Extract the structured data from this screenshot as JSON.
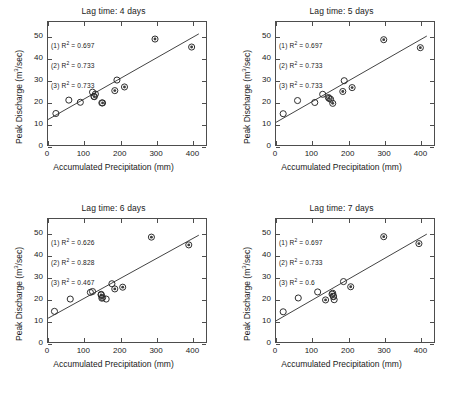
{
  "figure": {
    "axis_label_x": "Accumulated Precipitation (mm)",
    "axis_label_y_pre": "Peak Discharge (m",
    "axis_label_y_sup": "3",
    "axis_label_y_post": "/sec)",
    "r2_symbol": "R",
    "r2_exponent": "2"
  },
  "chart_data": [
    {
      "type": "scatter",
      "title": "Lag time: 4 days",
      "xlabel": "Accumulated Precipitation (mm)",
      "ylabel": "Peak Discharge (m3/sec)",
      "xlim": [
        0,
        440
      ],
      "ylim": [
        0,
        57
      ],
      "xticks": [
        0,
        100,
        200,
        300,
        400
      ],
      "yticks": [
        0,
        10,
        20,
        30,
        40,
        50
      ],
      "grid": false,
      "annotations": [
        "(1) R2 = 0.697",
        "(2) R2 = 0.733",
        "(3) R2 = 0.733"
      ],
      "r2_values": [
        0.697,
        0.733,
        0.733
      ],
      "fit_line": {
        "x0": 0,
        "y0": 11.8,
        "x1": 420,
        "y1": 51.5
      },
      "series": [
        {
          "name": "open-circle",
          "marker": "open",
          "points": [
            [
              22,
              14.6
            ],
            [
              58,
              20.8
            ],
            [
              90,
              19.8
            ],
            [
              124,
              24.5
            ],
            [
              132,
              23.6
            ],
            [
              128,
              22.5
            ],
            [
              150,
              19.5
            ],
            [
              192,
              30.1
            ]
          ]
        },
        {
          "name": "dotted-circle",
          "marker": "dot",
          "points": [
            [
              129,
              22.4
            ],
            [
              152,
              19.5
            ],
            [
              186,
              25.2
            ],
            [
              213,
              26.9
            ],
            [
              298,
              49.1
            ],
            [
              400,
              45.4
            ]
          ]
        }
      ]
    },
    {
      "type": "scatter",
      "title": "Lag time: 5 days",
      "xlabel": "Accumulated Precipitation (mm)",
      "ylabel": "Peak Discharge (m3/sec)",
      "xlim": [
        0,
        440
      ],
      "ylim": [
        0,
        57
      ],
      "xticks": [
        0,
        100,
        200,
        300,
        400
      ],
      "yticks": [
        0,
        10,
        20,
        30,
        40,
        50
      ],
      "grid": false,
      "annotations": [
        "(1) R2 = 0.697",
        "(2) R2 = 0.733",
        "(3) R2 = 0.733"
      ],
      "r2_values": [
        0.697,
        0.733,
        0.733
      ],
      "fit_line": {
        "x0": 0,
        "y0": 10.5,
        "x1": 420,
        "y1": 50.5
      },
      "series": [
        {
          "name": "open-circle",
          "marker": "open",
          "points": [
            [
              20,
              14.5
            ],
            [
              60,
              20.6
            ],
            [
              108,
              19.7
            ],
            [
              130,
              23.5
            ],
            [
              146,
              22.0
            ],
            [
              152,
              21.2
            ],
            [
              190,
              29.8
            ]
          ]
        },
        {
          "name": "dotted-circle",
          "marker": "dot",
          "points": [
            [
              148,
              21.6
            ],
            [
              158,
              19.3
            ],
            [
              186,
              24.8
            ],
            [
              212,
              26.6
            ],
            [
              300,
              48.8
            ],
            [
              402,
              45.1
            ]
          ]
        }
      ]
    },
    {
      "type": "scatter",
      "title": "Lag time: 6 days",
      "xlabel": "Accumulated Precipitation (mm)",
      "ylabel": "Peak Discharge (m3/sec)",
      "xlim": [
        0,
        440
      ],
      "ylim": [
        0,
        57
      ],
      "xticks": [
        0,
        100,
        200,
        300,
        400
      ],
      "yticks": [
        0,
        10,
        20,
        30,
        40,
        50
      ],
      "grid": false,
      "annotations": [
        "(1) R2 = 0.626",
        "(2) R2 = 0.828",
        "(3) R2 = 0.467"
      ],
      "r2_values": [
        0.626,
        0.828,
        0.467
      ],
      "fit_line": {
        "x0": 0,
        "y0": 11.0,
        "x1": 420,
        "y1": 49.5
      },
      "series": [
        {
          "name": "open-circle",
          "marker": "open",
          "points": [
            [
              18,
              14.2
            ],
            [
              62,
              19.9
            ],
            [
              118,
              23.0
            ],
            [
              124,
              23.4
            ],
            [
              148,
              22.1
            ],
            [
              152,
              20.6
            ],
            [
              162,
              19.9
            ],
            [
              178,
              27.0
            ]
          ]
        },
        {
          "name": "dotted-circle",
          "marker": "dot",
          "points": [
            [
              148,
              21.8
            ],
            [
              150,
              20.3
            ],
            [
              186,
              24.6
            ],
            [
              208,
              25.4
            ],
            [
              288,
              48.6
            ],
            [
              392,
              45.0
            ]
          ]
        }
      ]
    },
    {
      "type": "scatter",
      "title": "Lag time: 7 days",
      "xlabel": "Accumulated Precipitation (mm)",
      "ylabel": "Peak Discharge (m3/sec)",
      "xlim": [
        0,
        440
      ],
      "ylim": [
        0,
        57
      ],
      "xticks": [
        0,
        100,
        200,
        300,
        400
      ],
      "yticks": [
        0,
        10,
        20,
        30,
        40,
        50
      ],
      "grid": false,
      "annotations": [
        "(1) R2 = 0.697",
        "(2) R2 = 0.733",
        "(3) R2 = 0.6"
      ],
      "r2_values": [
        0.697,
        0.733,
        0.6
      ],
      "fit_line": {
        "x0": 0,
        "y0": 9.8,
        "x1": 420,
        "y1": 50.0
      },
      "series": [
        {
          "name": "open-circle",
          "marker": "open",
          "points": [
            [
              20,
              14.0
            ],
            [
              62,
              20.4
            ],
            [
              116,
              23.2
            ],
            [
              158,
              22.6
            ],
            [
              160,
              21.2
            ],
            [
              162,
              19.6
            ],
            [
              188,
              28.0
            ]
          ]
        },
        {
          "name": "dotted-circle",
          "marker": "dot",
          "points": [
            [
              156,
              22.2
            ],
            [
              138,
              19.5
            ],
            [
              160,
              21.0
            ],
            [
              208,
              25.6
            ],
            [
              300,
              48.8
            ],
            [
              398,
              45.6
            ]
          ]
        }
      ]
    }
  ]
}
